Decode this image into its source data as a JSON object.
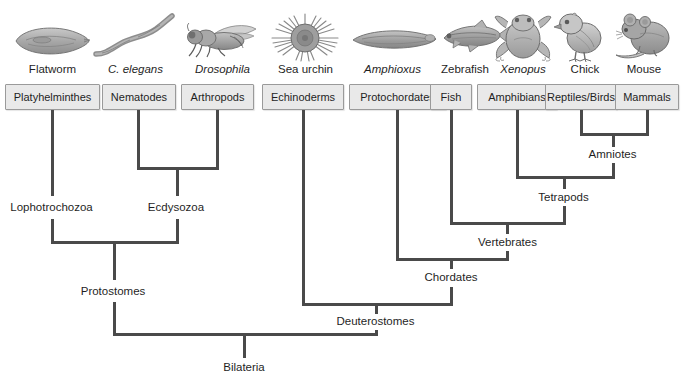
{
  "diagram": {
    "line_color": "#4a4a4a",
    "box_fill": "#e9e9e9",
    "box_border": "#9a9a9a",
    "text_color": "#1f1f1f"
  },
  "organisms": [
    {
      "common_name": "Flatworm",
      "italic": false,
      "icon": "flatworm-illustration",
      "taxon": "Platyhelminthes"
    },
    {
      "common_name": "C. elegans",
      "italic": true,
      "icon": "nematode-illustration",
      "taxon": "Nematodes"
    },
    {
      "common_name": "Drosophila",
      "italic": true,
      "icon": "fruitfly-illustration",
      "taxon": "Arthropods"
    },
    {
      "common_name": "Sea urchin",
      "italic": false,
      "icon": "sea-urchin-illustration",
      "taxon": "Echinoderms"
    },
    {
      "common_name": "Amphioxus",
      "italic": true,
      "icon": "lancelet-illustration",
      "taxon": "Protochordates"
    },
    {
      "common_name": "Zebrafish",
      "italic": false,
      "icon": "zebrafish-illustration",
      "taxon": "Fish"
    },
    {
      "common_name": "Xenopus",
      "italic": true,
      "icon": "frog-illustration",
      "taxon": "Amphibians"
    },
    {
      "common_name": "Chick",
      "italic": false,
      "icon": "chick-illustration",
      "taxon": "Reptiles/Birds"
    },
    {
      "common_name": "Mouse",
      "italic": false,
      "icon": "mouse-illustration",
      "taxon": "Mammals"
    }
  ],
  "clades": [
    {
      "name": "Lophotrochozoa",
      "label": "Lophotrochozoa"
    },
    {
      "name": "Ecdysozoa",
      "label": "Ecdysozoa"
    },
    {
      "name": "Protostomes",
      "label": "Protostomes"
    },
    {
      "name": "Amniotes",
      "label": "Amniotes"
    },
    {
      "name": "Tetrapods",
      "label": "Tetrapods"
    },
    {
      "name": "Vertebrates",
      "label": "Vertebrates"
    },
    {
      "name": "Chordates",
      "label": "Chordates"
    },
    {
      "name": "Deuterostomes",
      "label": "Deuterostomes"
    },
    {
      "name": "Bilateria",
      "label": "Bilateria"
    }
  ]
}
